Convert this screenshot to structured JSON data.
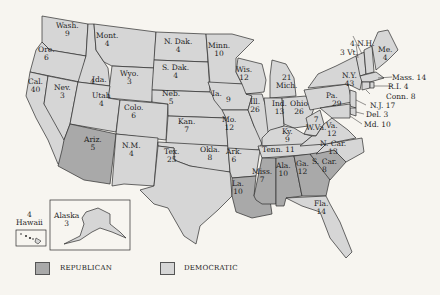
{
  "map": {
    "type": "US presidential electoral vote map",
    "colors": {
      "republican": "#a9a9a9",
      "democratic": "#d6d6d6",
      "background": "#f7f5f0",
      "border": "#2b2b2b"
    },
    "legend": [
      {
        "party": "REPUBLICAN",
        "color": "#a9a9a9"
      },
      {
        "party": "DEMOCRATIC",
        "color": "#d6d6d6"
      }
    ],
    "totals": {
      "republican_states": 7,
      "republican_votes": 52
    },
    "states": [
      {
        "abbr": "Wash.",
        "votes": "9",
        "party": "D"
      },
      {
        "abbr": "Ore.",
        "votes": "6",
        "party": "D"
      },
      {
        "abbr": "Cal.",
        "votes": "40",
        "party": "D"
      },
      {
        "abbr": "Nev.",
        "votes": "3",
        "party": "D"
      },
      {
        "abbr": "Ida.",
        "votes": "4",
        "party": "D"
      },
      {
        "abbr": "Mont.",
        "votes": "4",
        "party": "D"
      },
      {
        "abbr": "Wyo.",
        "votes": "3",
        "party": "D"
      },
      {
        "abbr": "Utah",
        "votes": "4",
        "party": "D"
      },
      {
        "abbr": "Colo.",
        "votes": "6",
        "party": "D"
      },
      {
        "abbr": "Ariz.",
        "votes": "5",
        "party": "R"
      },
      {
        "abbr": "N.M.",
        "votes": "4",
        "party": "D"
      },
      {
        "abbr": "N. Dak.",
        "votes": "4",
        "party": "D"
      },
      {
        "abbr": "S. Dak.",
        "votes": "4",
        "party": "D"
      },
      {
        "abbr": "Neb.",
        "votes": "5",
        "party": "D"
      },
      {
        "abbr": "Kan.",
        "votes": "7",
        "party": "D"
      },
      {
        "abbr": "Okla.",
        "votes": "8",
        "party": "D"
      },
      {
        "abbr": "Tex.",
        "votes": "25",
        "party": "D"
      },
      {
        "abbr": "Minn.",
        "votes": "10",
        "party": "D"
      },
      {
        "abbr": "Ia.",
        "votes": "9",
        "party": "D"
      },
      {
        "abbr": "Mo.",
        "votes": "12",
        "party": "D"
      },
      {
        "abbr": "Ark.",
        "votes": "6",
        "party": "D"
      },
      {
        "abbr": "La.",
        "votes": "10",
        "party": "R"
      },
      {
        "abbr": "Wis.",
        "votes": "12",
        "party": "D"
      },
      {
        "abbr": "Ill.",
        "votes": "26",
        "party": "D"
      },
      {
        "abbr": "Mich.",
        "votes": "21",
        "party": "D"
      },
      {
        "abbr": "Ind.",
        "votes": "13",
        "party": "D"
      },
      {
        "abbr": "Ohio",
        "votes": "26",
        "party": "D"
      },
      {
        "abbr": "Ky.",
        "votes": "9",
        "party": "D"
      },
      {
        "abbr": "Tenn.",
        "votes": "11",
        "party": "D"
      },
      {
        "abbr": "Miss.",
        "votes": "7",
        "party": "R"
      },
      {
        "abbr": "Ala.",
        "votes": "10",
        "party": "R"
      },
      {
        "abbr": "Ga.",
        "votes": "12",
        "party": "R"
      },
      {
        "abbr": "S. Car.",
        "votes": "8",
        "party": "R"
      },
      {
        "abbr": "N. Car.",
        "votes": "13",
        "party": "D"
      },
      {
        "abbr": "Fla.",
        "votes": "14",
        "party": "D"
      },
      {
        "abbr": "W.Va.",
        "votes": "7",
        "party": "D"
      },
      {
        "abbr": "Va.",
        "votes": "12",
        "party": "D"
      },
      {
        "abbr": "Pa.",
        "votes": "29",
        "party": "D"
      },
      {
        "abbr": "N.Y.",
        "votes": "43",
        "party": "D"
      },
      {
        "abbr": "Vt.",
        "votes": "3",
        "party": "D"
      },
      {
        "abbr": "N.H.",
        "votes": "4",
        "party": "D"
      },
      {
        "abbr": "Me.",
        "votes": "4",
        "party": "D"
      },
      {
        "abbr": "Mass.",
        "votes": "14",
        "party": "D"
      },
      {
        "abbr": "R.I.",
        "votes": "4",
        "party": "D"
      },
      {
        "abbr": "Conn.",
        "votes": "8",
        "party": "D"
      },
      {
        "abbr": "N.J.",
        "votes": "17",
        "party": "D"
      },
      {
        "abbr": "Del.",
        "votes": "3",
        "party": "D"
      },
      {
        "abbr": "Md.",
        "votes": "10",
        "party": "D"
      },
      {
        "abbr": "Alaska",
        "votes": "3",
        "party": "D"
      },
      {
        "abbr": "Hawaii",
        "votes": "4",
        "party": "D"
      }
    ],
    "labels": {
      "wash": {
        "name": "Wash.",
        "votes": "9"
      },
      "ore": {
        "name": "Ore.",
        "votes": "6"
      },
      "cal": {
        "name": "Cal.",
        "votes": "40"
      },
      "nev": {
        "name": "Nev.",
        "votes": "3"
      },
      "ida": {
        "name": "Ida.",
        "votes": "4"
      },
      "mont": {
        "name": "Mont.",
        "votes": "4"
      },
      "wyo": {
        "name": "Wyo.",
        "votes": "3"
      },
      "utah": {
        "name": "Utah",
        "votes": "4"
      },
      "colo": {
        "name": "Colo.",
        "votes": "6"
      },
      "ariz": {
        "name": "Ariz.",
        "votes": "5"
      },
      "nm": {
        "name": "N.M.",
        "votes": "4"
      },
      "ndak": {
        "name": "N. Dak.",
        "votes": "4"
      },
      "sdak": {
        "name": "S. Dak.",
        "votes": "4"
      },
      "neb": {
        "name": "Neb.",
        "votes": "5"
      },
      "kan": {
        "name": "Kan.",
        "votes": "7"
      },
      "okla": {
        "name": "Okla.",
        "votes": "8"
      },
      "tex": {
        "name": "Tex.",
        "votes": "25"
      },
      "minn": {
        "name": "Minn.",
        "votes": "10"
      },
      "ia": {
        "name": "Ia.",
        "votes": "9"
      },
      "mo": {
        "name": "Mo.",
        "votes": "12"
      },
      "ark": {
        "name": "Ark.",
        "votes": "6"
      },
      "la": {
        "name": "La.",
        "votes": "10"
      },
      "wis": {
        "name": "Wis.",
        "votes": "12"
      },
      "ill": {
        "name": "Ill.",
        "votes": "26"
      },
      "mich": {
        "name": "Mich.",
        "votes": "21"
      },
      "ind": {
        "name": "Ind.",
        "votes": "13"
      },
      "ohio": {
        "name": "Ohio",
        "votes": "26"
      },
      "ky": {
        "name": "Ky.",
        "votes": "9"
      },
      "tenn": {
        "name": "Tenn. 11"
      },
      "miss": {
        "name": "Miss.",
        "votes": "7"
      },
      "ala": {
        "name": "Ala.",
        "votes": "10"
      },
      "ga": {
        "name": "Ga.",
        "votes": "12"
      },
      "scar": {
        "name": "S. Car.",
        "votes": "8"
      },
      "ncar": {
        "name": "N. Car.",
        "votes": "13"
      },
      "fla": {
        "name": "Fla.",
        "votes": "14"
      },
      "wva": {
        "name": "W.Va.",
        "votes": "7"
      },
      "va": {
        "name": "Va.",
        "votes": "12"
      },
      "pa": {
        "name": "Pa.",
        "votes": "29"
      },
      "ny": {
        "name": "N.Y.",
        "votes": "43"
      },
      "vt": {
        "name": "3 Vt."
      },
      "nh": {
        "name": "4 N.H."
      },
      "me": {
        "name": "Me.",
        "votes": "4"
      },
      "mass": {
        "name": "Mass. 14"
      },
      "ri": {
        "name": "R.I. 4"
      },
      "conn": {
        "name": "Conn. 8"
      },
      "nj": {
        "name": "N.J. 17"
      },
      "del": {
        "name": "Del. 3"
      },
      "md": {
        "name": "Md. 10"
      },
      "alaska": {
        "name": "Alaska",
        "votes": "3"
      },
      "hawaii": {
        "name": "Hawaii",
        "votes": "4"
      }
    }
  }
}
